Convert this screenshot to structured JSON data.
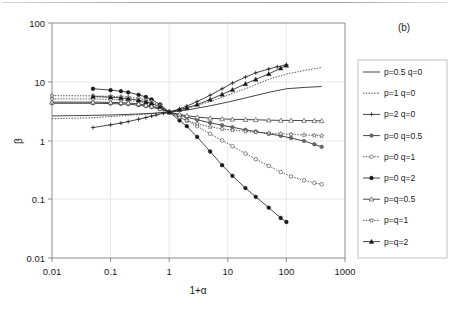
{
  "panel": {
    "label": "(b)"
  },
  "axes": {
    "x": {
      "title": "1+α",
      "ticks": [
        "0.01",
        "0.1",
        "1",
        "10",
        "100",
        "1000"
      ],
      "scale": "log",
      "min": 0.01,
      "max": 1000
    },
    "y": {
      "title": "β",
      "ticks": [
        "0.01",
        "0.1",
        "1",
        "10",
        "100"
      ],
      "scale": "log",
      "min": 0.01,
      "max": 100
    }
  },
  "legend": {
    "position": "right",
    "entries": [
      {
        "label": "p=0.5 q=0",
        "marker": "none",
        "dash": "solid"
      },
      {
        "label": "p=1 q=0",
        "marker": "none",
        "dash": "dotted"
      },
      {
        "label": "p=2 q=0",
        "marker": "plus",
        "dash": "solid"
      },
      {
        "label": "p=0 q=0.5",
        "marker": "filled-circle-gray",
        "dash": "solid"
      },
      {
        "label": "p=0 q=1",
        "marker": "open-circle",
        "dash": "dotted"
      },
      {
        "label": "p=0 q=2",
        "marker": "filled-circle",
        "dash": "solid"
      },
      {
        "label": "p=q=0.5",
        "marker": "open-triangle",
        "dash": "solid"
      },
      {
        "label": "p=q=1",
        "marker": "open-star",
        "dash": "dotted"
      },
      {
        "label": "p=q=2",
        "marker": "filled-triangle",
        "dash": "solid"
      }
    ]
  },
  "colors": {
    "axis": "#808080",
    "grid": "#d6d6d6",
    "series": "#262626",
    "background": "#ffffff"
  },
  "chart_data": {
    "type": "line",
    "title": "",
    "xlabel": "1+α",
    "ylabel": "β",
    "xscale": "log",
    "yscale": "log",
    "xlim": [
      0.01,
      1000
    ],
    "ylim": [
      0.01,
      100
    ],
    "grid": true,
    "legend_position": "right",
    "series": [
      {
        "name": "p=0.5 q=0",
        "marker": "none",
        "dash": "solid",
        "x": [
          0.01,
          0.02,
          0.05,
          0.1,
          0.2,
          0.5,
          1,
          2,
          5,
          10,
          20,
          50,
          100,
          200,
          400
        ],
        "y": [
          2.62,
          2.64,
          2.68,
          2.72,
          2.78,
          2.9,
          3.05,
          3.3,
          3.9,
          4.5,
          5.3,
          6.6,
          7.6,
          8.0,
          8.3
        ]
      },
      {
        "name": "p=1 q=0",
        "marker": "none",
        "dash": "dotted",
        "x": [
          0.01,
          0.02,
          0.05,
          0.1,
          0.2,
          0.5,
          1,
          2,
          5,
          10,
          20,
          50,
          100,
          200,
          400
        ],
        "y": [
          2.35,
          2.38,
          2.45,
          2.55,
          2.68,
          2.85,
          3.05,
          3.5,
          4.6,
          5.9,
          7.6,
          11.0,
          13.5,
          15.5,
          17.5
        ]
      },
      {
        "name": "p=2 q=0",
        "marker": "plus",
        "dash": "solid",
        "x": [
          0.05,
          0.1,
          0.15,
          0.2,
          0.3,
          0.4,
          0.5,
          0.6,
          0.8,
          1,
          1.5,
          2,
          3,
          5,
          8,
          12,
          20,
          30,
          50,
          70,
          100
        ],
        "y": [
          1.66,
          1.85,
          1.98,
          2.1,
          2.3,
          2.46,
          2.6,
          2.72,
          2.9,
          3.05,
          3.45,
          3.85,
          4.6,
          5.9,
          7.6,
          9.5,
          12.0,
          14.2,
          16.5,
          18.0,
          19.5
        ]
      },
      {
        "name": "p=0 q=0.5",
        "marker": "filled-circle-gray",
        "dash": "solid",
        "x": [
          0.01,
          0.05,
          0.1,
          0.15,
          0.2,
          0.3,
          0.4,
          0.5,
          0.7,
          1,
          1.5,
          2,
          3,
          5,
          8,
          12,
          20,
          30,
          50,
          80,
          120,
          200,
          300,
          400
        ],
        "y": [
          4.3,
          4.3,
          4.25,
          4.2,
          4.15,
          4.0,
          3.85,
          3.7,
          3.4,
          3.05,
          2.7,
          2.5,
          2.25,
          2.0,
          1.82,
          1.68,
          1.52,
          1.42,
          1.3,
          1.2,
          1.1,
          0.98,
          0.86,
          0.78
        ]
      },
      {
        "name": "p=0 q=1",
        "marker": "open-circle",
        "dash": "dotted",
        "x": [
          0.01,
          0.05,
          0.1,
          0.15,
          0.2,
          0.3,
          0.4,
          0.5,
          0.7,
          1,
          1.5,
          2,
          3,
          5,
          8,
          12,
          20,
          30,
          50,
          80,
          120,
          200,
          300,
          400
        ],
        "y": [
          5.1,
          5.1,
          5.0,
          4.92,
          4.82,
          4.6,
          4.35,
          4.1,
          3.6,
          3.05,
          2.5,
          2.18,
          1.75,
          1.3,
          1.0,
          0.8,
          0.6,
          0.48,
          0.37,
          0.29,
          0.245,
          0.21,
          0.19,
          0.18
        ]
      },
      {
        "name": "p=0 q=2",
        "marker": "filled-circle",
        "dash": "solid",
        "x": [
          0.05,
          0.1,
          0.15,
          0.2,
          0.3,
          0.4,
          0.5,
          0.7,
          1,
          1.5,
          2,
          3,
          5,
          8,
          12,
          20,
          30,
          50,
          80,
          100
        ],
        "y": [
          7.6,
          7.2,
          6.9,
          6.6,
          6.0,
          5.5,
          5.0,
          4.1,
          3.05,
          2.2,
          1.75,
          1.15,
          0.65,
          0.38,
          0.25,
          0.155,
          0.11,
          0.072,
          0.048,
          0.041
        ]
      },
      {
        "name": "p=q=0.5",
        "marker": "open-triangle",
        "dash": "solid",
        "x": [
          0.01,
          0.05,
          0.1,
          0.15,
          0.2,
          0.3,
          0.4,
          0.5,
          0.7,
          1,
          1.5,
          2,
          3,
          5,
          8,
          12,
          20,
          30,
          50,
          80,
          120,
          200,
          300,
          400
        ],
        "y": [
          4.5,
          4.5,
          4.45,
          4.4,
          4.35,
          4.2,
          4.0,
          3.85,
          3.5,
          3.05,
          2.78,
          2.65,
          2.5,
          2.4,
          2.33,
          2.3,
          2.27,
          2.25,
          2.22,
          2.2,
          2.2,
          2.18,
          2.17,
          2.16
        ]
      },
      {
        "name": "p=q=1",
        "marker": "open-star",
        "dash": "dotted",
        "x": [
          0.01,
          0.05,
          0.1,
          0.15,
          0.2,
          0.3,
          0.4,
          0.5,
          0.7,
          1,
          1.5,
          2,
          3,
          5,
          8,
          12,
          20,
          30,
          50,
          80,
          120,
          200,
          300,
          400
        ],
        "y": [
          5.8,
          5.75,
          5.65,
          5.55,
          5.45,
          5.2,
          4.9,
          4.6,
          3.95,
          3.05,
          2.45,
          2.2,
          1.92,
          1.7,
          1.58,
          1.5,
          1.43,
          1.38,
          1.33,
          1.3,
          1.27,
          1.24,
          1.22,
          1.2
        ]
      },
      {
        "name": "p=q=2",
        "marker": "filled-triangle",
        "dash": "solid",
        "x": [
          0.05,
          0.1,
          0.15,
          0.2,
          0.3,
          0.4,
          0.5,
          0.7,
          1,
          1.5,
          2,
          3,
          5,
          8,
          12,
          20,
          30,
          50,
          80,
          100
        ],
        "y": [
          5.6,
          5.45,
          5.3,
          5.15,
          4.85,
          4.55,
          4.3,
          3.75,
          3.05,
          3.35,
          3.6,
          4.1,
          5.0,
          6.1,
          7.3,
          9.2,
          11.0,
          13.6,
          17.0,
          19.0
        ]
      }
    ],
    "note": "All nine curves pass through a common crossing point at x=1, beta=3.05"
  }
}
